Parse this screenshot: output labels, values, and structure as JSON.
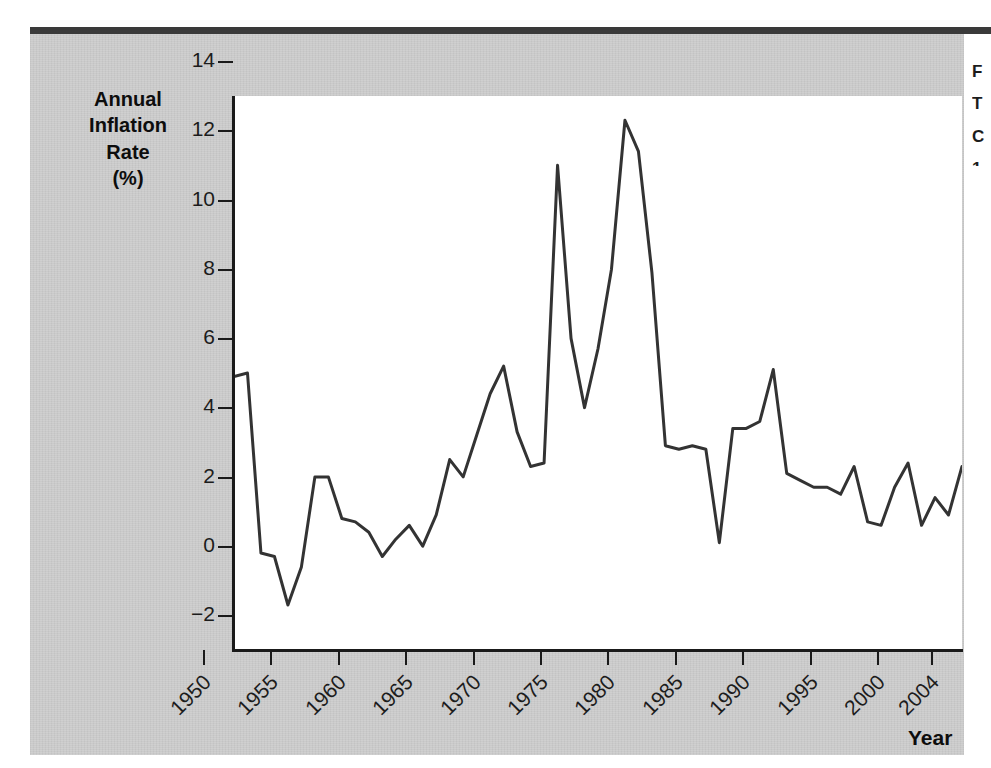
{
  "figure": {
    "background_color": "#cacaca",
    "plot_background_color": "#ffffff",
    "line_color": "#333333",
    "axis_color": "#1a1a1a"
  },
  "axis_titles": {
    "y_line1": "Annual",
    "y_line2": "Inflation",
    "y_line3": "Rate",
    "y_line4": "(%)",
    "x": "Year"
  },
  "margin_note": {
    "line1": "F",
    "line2": "T",
    "line3": "C",
    "line4": "1"
  },
  "chart_data": {
    "type": "line",
    "title": "",
    "xlabel": "Year",
    "ylabel": "Annual Inflation Rate (%)",
    "xlim": [
      1950,
      2004
    ],
    "ylim": [
      -2,
      14
    ],
    "grid": false,
    "legend_position": "none",
    "y_ticks": [
      14,
      12,
      10,
      8,
      6,
      4,
      2,
      0,
      -2
    ],
    "y_tick_labels": [
      "14",
      "12",
      "10",
      "8",
      "6",
      "4",
      "2",
      "0",
      "−2"
    ],
    "x_ticks": [
      1950,
      1955,
      1960,
      1965,
      1970,
      1975,
      1980,
      1985,
      1990,
      1995,
      2000,
      2004
    ],
    "x_tick_labels": [
      "1950",
      "1955",
      "1960",
      "1965",
      "1970",
      "1975",
      "1980",
      "1985",
      "1990",
      "1995",
      "2000",
      "2004"
    ],
    "series": [
      {
        "name": "Annual Inflation Rate",
        "x": [
          1950,
          1951,
          1952,
          1953,
          1954,
          1955,
          1956,
          1957,
          1958,
          1959,
          1960,
          1961,
          1962,
          1963,
          1964,
          1965,
          1966,
          1967,
          1968,
          1969,
          1970,
          1971,
          1972,
          1973,
          1974,
          1975,
          1976,
          1977,
          1978,
          1979,
          1980,
          1981,
          1982,
          1983,
          1984,
          1985,
          1986,
          1987,
          1988,
          1989,
          1990,
          1991,
          1992,
          1993,
          1994,
          1995,
          1996,
          1997,
          1998,
          1999,
          2000,
          2001,
          2002,
          2003,
          2004
        ],
        "values": [
          5.9,
          6.0,
          0.8,
          0.7,
          -0.7,
          0.4,
          3.0,
          3.0,
          1.8,
          1.7,
          1.4,
          0.7,
          1.2,
          1.6,
          1.0,
          1.9,
          3.5,
          3.0,
          4.2,
          5.4,
          6.2,
          4.3,
          3.3,
          3.4,
          12.0,
          7.0,
          5.0,
          6.7,
          9.0,
          13.3,
          12.4,
          8.9,
          3.9,
          3.8,
          3.9,
          3.8,
          1.1,
          4.4,
          4.4,
          4.6,
          6.1,
          3.1,
          2.9,
          2.7,
          2.7,
          2.5,
          3.3,
          1.7,
          1.6,
          2.7,
          3.4,
          1.6,
          2.4,
          1.9,
          3.3
        ],
        "color": "#333333"
      }
    ]
  }
}
